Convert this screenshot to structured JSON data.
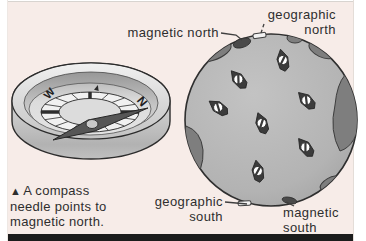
{
  "labels": {
    "magnetic_north": {
      "text": "magnetic north"
    },
    "geographic_north": {
      "line1": "geographic",
      "line2": "north"
    },
    "geographic_south": {
      "line1": "geographic",
      "line2": "south"
    },
    "magnetic_south": {
      "line1": "magnetic",
      "line2": "south"
    }
  },
  "caption": {
    "marker": "▲",
    "line1": "A compass",
    "line2": "needle points to",
    "line3": "magnetic north."
  },
  "compass": {
    "dial_letters": [
      {
        "ch": "N",
        "x": 139,
        "y": 104,
        "rot": 50,
        "size": 12
      },
      {
        "ch": "W",
        "x": 52,
        "y": 96,
        "rot": -48,
        "size": 11
      }
    ],
    "north_tick": {
      "x": 97,
      "y": 88,
      "rot": 15
    }
  },
  "globe": {
    "needles": [
      {
        "x": 283,
        "y": 61,
        "angle": -12
      },
      {
        "x": 239,
        "y": 80,
        "angle": -40
      },
      {
        "x": 219,
        "y": 108,
        "angle": -55
      },
      {
        "x": 307,
        "y": 101,
        "angle": -45
      },
      {
        "x": 262,
        "y": 124,
        "angle": -20
      },
      {
        "x": 306,
        "y": 148,
        "angle": -38
      },
      {
        "x": 258,
        "y": 172,
        "angle": -10
      }
    ]
  },
  "colors": {
    "page_background": "#ffffff",
    "panel_background": "#f7ece8",
    "rule_color": "#1c1c1c",
    "text_color": "#2e2e2e",
    "globe_fill": "#b5b5b5",
    "continent_fill": "#7e7e7e",
    "outline_color": "#2f2f2f",
    "ring_fill": "#f1f1f1",
    "card_fill": "#dcdcdc",
    "needle_fill": "#565656",
    "globe_needle_fill": "#3c3c3c",
    "white_marker": "#f2f2f2"
  }
}
